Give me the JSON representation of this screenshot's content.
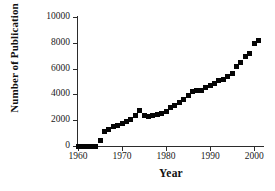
{
  "figure": {
    "width": 275,
    "height": 191,
    "background": "#ffffff",
    "marker_color": "#050505",
    "axis_color": "#2b2b2b"
  },
  "chart_data": {
    "type": "scatter",
    "title": "",
    "subtitle": "",
    "xlabel": "Year",
    "ylabel": "Number of Publication",
    "xlim": [
      1960,
      2002
    ],
    "ylim": [
      0,
      10000
    ],
    "grid": false,
    "legend": null,
    "legend_position": "none",
    "marker": "filled-square",
    "xticks": [
      1960,
      1970,
      1980,
      1990,
      2000
    ],
    "xtick_labels": [
      "1960",
      "1970",
      "1980",
      "1990",
      "2000"
    ],
    "yticks": [
      0,
      2000,
      4000,
      6000,
      8000,
      10000
    ],
    "ytick_labels": [
      "0",
      "2000",
      "4000",
      "6000",
      "8000",
      "10000"
    ],
    "series": [
      {
        "name": "Number of Publication",
        "x": [
          1960,
          1961,
          1962,
          1963,
          1964,
          1965,
          1966,
          1967,
          1968,
          1969,
          1970,
          1971,
          1972,
          1973,
          1974,
          1975,
          1976,
          1977,
          1978,
          1979,
          1980,
          1981,
          1982,
          1983,
          1984,
          1985,
          1986,
          1987,
          1988,
          1989,
          1990,
          1991,
          1992,
          1993,
          1994,
          1995,
          1996,
          1997,
          1998,
          1999,
          2000,
          2001
        ],
        "y": [
          0,
          0,
          0,
          0,
          0,
          450,
          1150,
          1300,
          1500,
          1600,
          1750,
          1900,
          2050,
          2350,
          2750,
          2400,
          2250,
          2350,
          2450,
          2550,
          2700,
          2950,
          3150,
          3350,
          3600,
          3900,
          4250,
          4300,
          4300,
          4500,
          4700,
          4850,
          5050,
          5150,
          5400,
          5650,
          6200,
          6500,
          6900,
          7200,
          7950,
          8200
        ]
      }
    ]
  }
}
